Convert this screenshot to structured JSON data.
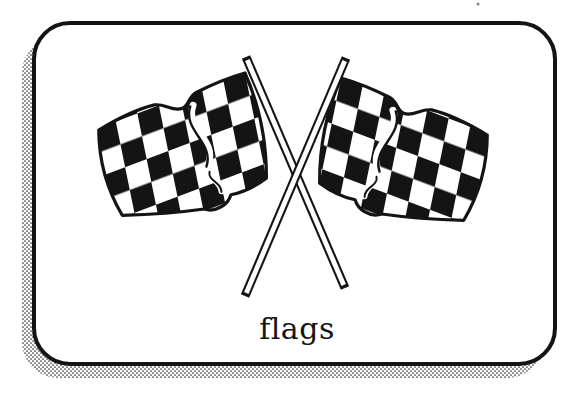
{
  "card": {
    "caption": "flags",
    "background_color": "#ffffff",
    "border_color": "#141414",
    "shadow_style": "halftone dot stipple, offset down-left"
  },
  "illustration": {
    "subject": "two crossed black-and-white checkered racing flags on angled poles",
    "ink_color": "#141414",
    "paper_color": "#ffffff",
    "pole_color": "#ffffff",
    "flags": [
      {
        "side": "left",
        "pattern": "black-and-white checkerboard",
        "tilt": "counterclockwise"
      },
      {
        "side": "right",
        "pattern": "black-and-white checkerboard",
        "tilt": "clockwise"
      }
    ]
  }
}
